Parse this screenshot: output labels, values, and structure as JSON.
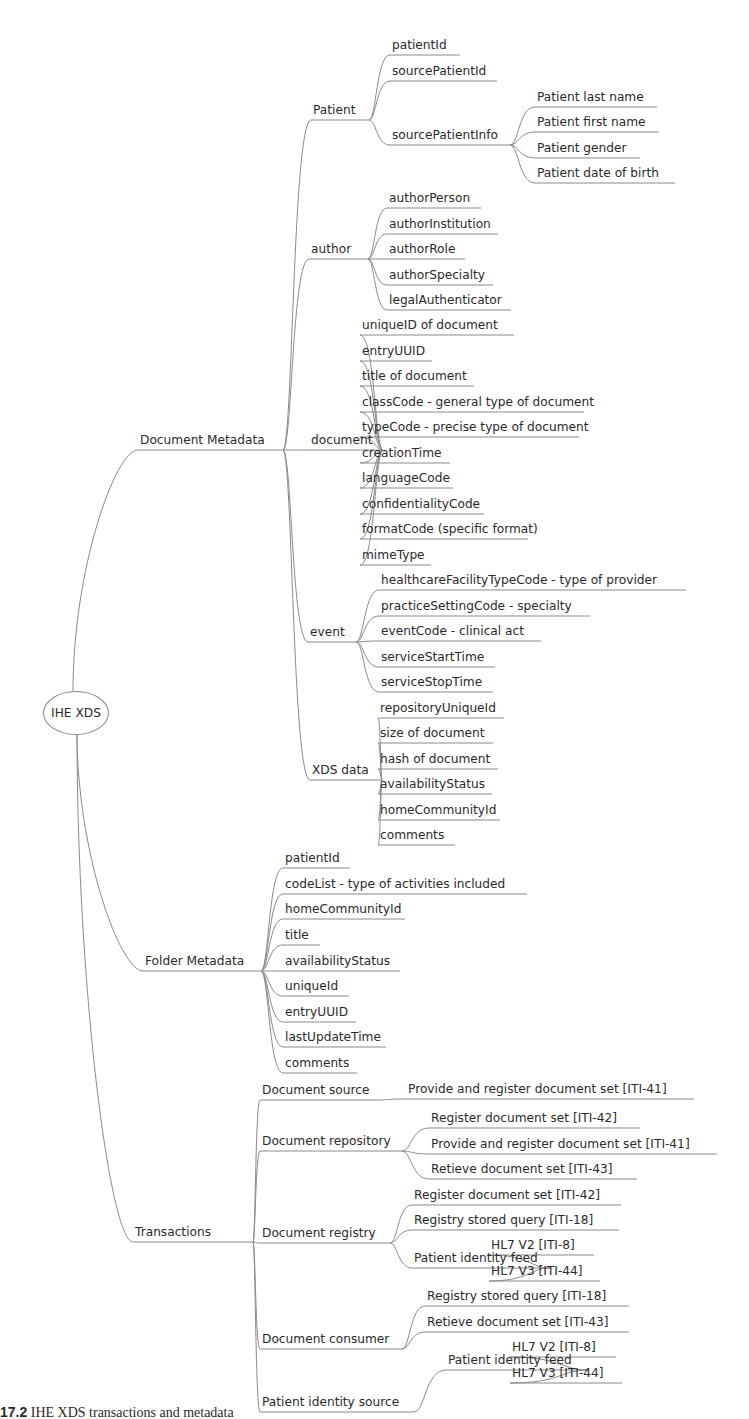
{
  "root": {
    "label": "IHE XDS",
    "x": 75,
    "y": 712
  },
  "nodes": [
    {
      "id": "document-metadata",
      "label": "Document Metadata",
      "x": 140,
      "y": 450,
      "w": 143,
      "parent": "root"
    },
    {
      "id": "folder-metadata",
      "label": "Folder Metadata",
      "x": 145,
      "y": 971,
      "w": 116,
      "parent": "root"
    },
    {
      "id": "transactions",
      "label": "Transactions",
      "x": 135,
      "y": 1242,
      "w": 118,
      "parent": "root"
    },
    {
      "id": "patient",
      "label": "Patient",
      "x": 313,
      "y": 120,
      "w": 56,
      "parent": "document-metadata"
    },
    {
      "id": "author",
      "label": "author",
      "x": 311,
      "y": 259,
      "w": 57,
      "parent": "document-metadata"
    },
    {
      "id": "document",
      "label": "document",
      "x": 311,
      "y": 450,
      "w": 72,
      "parent": "document-metadata"
    },
    {
      "id": "event",
      "label": "event",
      "x": 310,
      "y": 642,
      "w": 46,
      "parent": "document-metadata"
    },
    {
      "id": "xds-data",
      "label": "XDS data",
      "x": 312,
      "y": 780,
      "w": 70,
      "parent": "document-metadata"
    },
    {
      "id": "p1",
      "label": "patientId",
      "x": 392,
      "y": 55,
      "w": 68,
      "parent": "patient"
    },
    {
      "id": "p2",
      "label": "sourcePatientId",
      "x": 392,
      "y": 81,
      "w": 105,
      "parent": "patient"
    },
    {
      "id": "p3",
      "label": "sourcePatientInfo",
      "x": 392,
      "y": 145,
      "w": 118,
      "parent": "patient"
    },
    {
      "id": "p3a",
      "label": "Patient last name",
      "x": 537,
      "y": 107,
      "w": 120,
      "parent": "p3"
    },
    {
      "id": "p3b",
      "label": "Patient first name",
      "x": 537,
      "y": 132,
      "w": 122,
      "parent": "p3"
    },
    {
      "id": "p3c",
      "label": "Patient gender",
      "x": 537,
      "y": 158,
      "w": 103,
      "parent": "p3"
    },
    {
      "id": "p3d",
      "label": "Patient date of birth",
      "x": 537,
      "y": 183,
      "w": 138,
      "parent": "p3"
    },
    {
      "id": "a1",
      "label": "authorPerson",
      "x": 389,
      "y": 208,
      "w": 92,
      "parent": "author"
    },
    {
      "id": "a2",
      "label": "authorInstitution",
      "x": 389,
      "y": 234,
      "w": 109,
      "parent": "author"
    },
    {
      "id": "a3",
      "label": "authorRole",
      "x": 389,
      "y": 259,
      "w": 76,
      "parent": "author"
    },
    {
      "id": "a4",
      "label": "authorSpecialty",
      "x": 389,
      "y": 285,
      "w": 104,
      "parent": "author"
    },
    {
      "id": "a5",
      "label": "legalAuthenticator",
      "x": 389,
      "y": 310,
      "w": 122,
      "parent": "author"
    },
    {
      "id": "d1",
      "label": "uniqueID of document",
      "x": 362,
      "y": 335,
      "w": 152,
      "parent": "document"
    },
    {
      "id": "d2",
      "label": "entryUUID",
      "x": 362,
      "y": 361,
      "w": 70,
      "parent": "document"
    },
    {
      "id": "d3",
      "label": "title of document",
      "x": 362,
      "y": 386,
      "w": 112,
      "parent": "document"
    },
    {
      "id": "d4",
      "label": "classCode - general type of document",
      "x": 362,
      "y": 412,
      "w": 222,
      "parent": "document"
    },
    {
      "id": "d5",
      "label": "typeCode - precise type of document",
      "x": 362,
      "y": 437,
      "w": 217,
      "parent": "document"
    },
    {
      "id": "d6",
      "label": "creationTime",
      "x": 362,
      "y": 463,
      "w": 88,
      "parent": "document"
    },
    {
      "id": "d7",
      "label": "languageCode",
      "x": 362,
      "y": 488,
      "w": 91,
      "parent": "document"
    },
    {
      "id": "d8",
      "label": "confidentialityCode",
      "x": 362,
      "y": 514,
      "w": 122,
      "parent": "document"
    },
    {
      "id": "d9",
      "label": "formatCode (specific format)",
      "x": 362,
      "y": 539,
      "w": 166,
      "parent": "document"
    },
    {
      "id": "d10",
      "label": "mimeType",
      "x": 362,
      "y": 565,
      "w": 69,
      "parent": "document"
    },
    {
      "id": "e1",
      "label": "healthcareFacilityTypeCode - type of provider",
      "x": 381,
      "y": 590,
      "w": 305,
      "parent": "event"
    },
    {
      "id": "e2",
      "label": "practiceSettingCode - specialty",
      "x": 381,
      "y": 616,
      "w": 209,
      "parent": "event"
    },
    {
      "id": "e3",
      "label": "eventCode - clinical act",
      "x": 381,
      "y": 641,
      "w": 160,
      "parent": "event"
    },
    {
      "id": "e4",
      "label": "serviceStartTime",
      "x": 381,
      "y": 667,
      "w": 114,
      "parent": "event"
    },
    {
      "id": "e5",
      "label": "serviceStopTime",
      "x": 381,
      "y": 692,
      "w": 112,
      "parent": "event"
    },
    {
      "id": "x1",
      "label": "repositoryUniqueId",
      "x": 380,
      "y": 718,
      "w": 124,
      "parent": "xds-data"
    },
    {
      "id": "x2",
      "label": "size of document",
      "x": 380,
      "y": 743,
      "w": 113,
      "parent": "xds-data"
    },
    {
      "id": "x3",
      "label": "hash of document",
      "x": 380,
      "y": 769,
      "w": 118,
      "parent": "xds-data"
    },
    {
      "id": "x4",
      "label": "availabilityStatus",
      "x": 380,
      "y": 794,
      "w": 112,
      "parent": "xds-data"
    },
    {
      "id": "x5",
      "label": "homeCommunityId",
      "x": 380,
      "y": 820,
      "w": 120,
      "parent": "xds-data"
    },
    {
      "id": "x6",
      "label": "comments",
      "x": 380,
      "y": 845,
      "w": 75,
      "parent": "xds-data"
    },
    {
      "id": "f1",
      "label": "patientId",
      "x": 285,
      "y": 868,
      "w": 65,
      "parent": "folder-metadata"
    },
    {
      "id": "f2",
      "label": "codeList - type of activities included",
      "x": 285,
      "y": 894,
      "w": 242,
      "parent": "folder-metadata"
    },
    {
      "id": "f3",
      "label": "homeCommunityId",
      "x": 285,
      "y": 919,
      "w": 120,
      "parent": "folder-metadata"
    },
    {
      "id": "f4",
      "label": "title",
      "x": 285,
      "y": 945,
      "w": 35,
      "parent": "folder-metadata"
    },
    {
      "id": "f5",
      "label": "availabilityStatus",
      "x": 285,
      "y": 971,
      "w": 115,
      "parent": "folder-metadata"
    },
    {
      "id": "f6",
      "label": "uniqueId",
      "x": 285,
      "y": 996,
      "w": 64,
      "parent": "folder-metadata"
    },
    {
      "id": "f7",
      "label": "entryUUID",
      "x": 285,
      "y": 1022,
      "w": 71,
      "parent": "folder-metadata"
    },
    {
      "id": "f8",
      "label": "lastUpdateTime",
      "x": 285,
      "y": 1047,
      "w": 101,
      "parent": "folder-metadata"
    },
    {
      "id": "f9",
      "label": "comments",
      "x": 285,
      "y": 1073,
      "w": 72,
      "parent": "folder-metadata"
    },
    {
      "id": "t1",
      "label": "Document source",
      "x": 262,
      "y": 1100,
      "w": 116,
      "parent": "transactions"
    },
    {
      "id": "t2",
      "label": "Document repository",
      "x": 262,
      "y": 1151,
      "w": 140,
      "parent": "transactions"
    },
    {
      "id": "t3",
      "label": "Document registry",
      "x": 262,
      "y": 1243,
      "w": 128,
      "parent": "transactions"
    },
    {
      "id": "t4",
      "label": "Document consumer",
      "x": 262,
      "y": 1349,
      "w": 140,
      "parent": "transactions"
    },
    {
      "id": "t5",
      "label": "Patient identity source",
      "x": 262,
      "y": 1412,
      "w": 152,
      "parent": "transactions"
    },
    {
      "id": "t1a",
      "label": "Provide and register document set [ITI-41]",
      "x": 408,
      "y": 1099,
      "w": 286,
      "parent": "t1"
    },
    {
      "id": "t2a",
      "label": "Register document set [ITI-42]",
      "x": 431,
      "y": 1128,
      "w": 209,
      "parent": "t2"
    },
    {
      "id": "t2b",
      "label": "Provide and register document set [ITI-41]",
      "x": 431,
      "y": 1154,
      "w": 286,
      "parent": "t2"
    },
    {
      "id": "t2c",
      "label": "Retieve document set [ITI-43]",
      "x": 431,
      "y": 1179,
      "w": 206,
      "parent": "t2"
    },
    {
      "id": "t3a",
      "label": "Register document set [ITI-42]",
      "x": 414,
      "y": 1205,
      "w": 207,
      "parent": "t3"
    },
    {
      "id": "t3b",
      "label": "Registry stored query [ITI-18]",
      "x": 414,
      "y": 1230,
      "w": 205,
      "parent": "t3"
    },
    {
      "id": "t3c",
      "label": "Patient identity feed",
      "x": 414,
      "y": 1268,
      "w": 137,
      "parent": "t3"
    },
    {
      "id": "t3c1",
      "label": "HL7 V2 [ITI-8]",
      "x": 491,
      "y": 1255,
      "w": 103,
      "parent": "t3c"
    },
    {
      "id": "t3c2",
      "label": "HL7 V3 [ITI-44]",
      "x": 491,
      "y": 1281,
      "w": 109,
      "parent": "t3c"
    },
    {
      "id": "t4a",
      "label": "Registry stored query [ITI-18]",
      "x": 427,
      "y": 1306,
      "w": 202,
      "parent": "t4"
    },
    {
      "id": "t4b",
      "label": "Retieve document set [ITI-43]",
      "x": 427,
      "y": 1332,
      "w": 202,
      "parent": "t4"
    },
    {
      "id": "t5a",
      "label": "Patient identity feed",
      "x": 448,
      "y": 1370,
      "w": 140,
      "parent": "t5"
    },
    {
      "id": "t5a1",
      "label": "HL7 V2 [ITI-8]",
      "x": 512,
      "y": 1357,
      "w": 104,
      "parent": "t5a"
    },
    {
      "id": "t5a2",
      "label": "HL7 V3 [ITI-44]",
      "x": 512,
      "y": 1383,
      "w": 110,
      "parent": "t5a"
    }
  ],
  "caption": {
    "prefix": "17.2",
    "text": " IHE XDS transactions and metadata"
  }
}
